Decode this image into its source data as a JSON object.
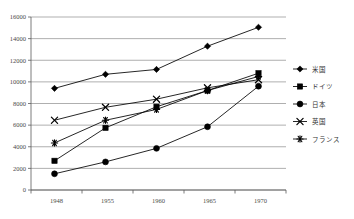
{
  "chart_data": {
    "type": "line",
    "title": "",
    "xlabel": "",
    "ylabel": "",
    "categories": [
      "1948",
      "1955",
      "1960",
      "1965",
      "1970"
    ],
    "ylim": [
      0,
      16000
    ],
    "ytick_step": 2000,
    "yticks": [
      "0",
      "2000",
      "4000",
      "6000",
      "8000",
      "10000",
      "12000",
      "14000",
      "16000"
    ],
    "grid": "horizontal",
    "legend_position": "right",
    "series": [
      {
        "name": "米国",
        "marker": "diamond",
        "color": "#000000",
        "values": [
          9400,
          10700,
          11150,
          13300,
          15050
        ]
      },
      {
        "name": "ドイツ",
        "marker": "square",
        "color": "#000000",
        "values": [
          2700,
          5750,
          7700,
          9200,
          10800
        ]
      },
      {
        "name": "日本",
        "marker": "circle",
        "color": "#000000",
        "values": [
          1500,
          2600,
          3850,
          5850,
          9600
        ]
      },
      {
        "name": "英国",
        "marker": "x",
        "color": "#000000",
        "values": [
          6450,
          7650,
          8400,
          9450,
          10200
        ]
      },
      {
        "name": "フランス",
        "marker": "asterisk",
        "color": "#000000",
        "values": [
          4350,
          6450,
          7450,
          9200,
          10500
        ]
      }
    ]
  },
  "legend": {
    "items": [
      {
        "label": "米国",
        "marker": "diamond"
      },
      {
        "label": "ドイツ",
        "marker": "square"
      },
      {
        "label": "日本",
        "marker": "circle"
      },
      {
        "label": "英国",
        "marker": "x"
      },
      {
        "label": "フランス",
        "marker": "asterisk"
      }
    ]
  },
  "colors": {
    "plot_border": "#7f7f7f",
    "gridline": "#8c8c8c",
    "axis": "#5a5a5a",
    "tick_text": "#4a4a4a",
    "series": "#000000",
    "background": "#ffffff"
  }
}
